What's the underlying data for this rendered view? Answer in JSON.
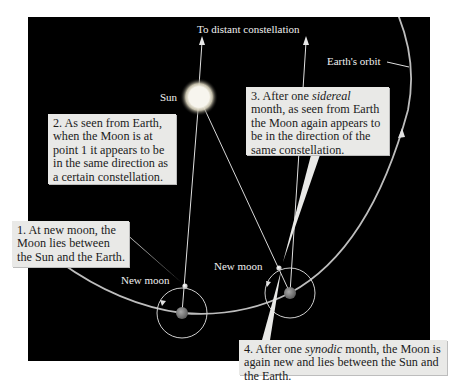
{
  "diagram": {
    "colors": {
      "space_background": "#000000",
      "page_background": "#ffffff",
      "callout_background": "#e9e9e7",
      "line_color": "#e6e6e6",
      "sun_glow": "#fff6d8",
      "earth_color": "#8a8a8a",
      "moon_color": "#f2f2f2"
    },
    "labels": {
      "distant_constellation": "To distant constellation",
      "sun": "Sun",
      "earths_orbit": "Earth's orbit",
      "new_moon_1": "New moon",
      "new_moon_2": "New moon"
    },
    "callouts": [
      {
        "id": 1,
        "parts": [
          "1. At new moon, the Moon lies between the Sun and the Earth."
        ]
      },
      {
        "id": 2,
        "parts": [
          "2. As seen from Earth, when the Moon is at point 1 it appears to be in the same direction as a certain constellation."
        ]
      },
      {
        "id": 3,
        "pre": "3. After one ",
        "em": "sidereal",
        "post": " month, as seen from Earth the Moon again appears to be in the direction of the same constellation."
      },
      {
        "id": 4,
        "pre": "4. After one ",
        "em": "synodic",
        "post": " month, the Moon is again new and lies between the Sun and the Earth."
      }
    ]
  }
}
